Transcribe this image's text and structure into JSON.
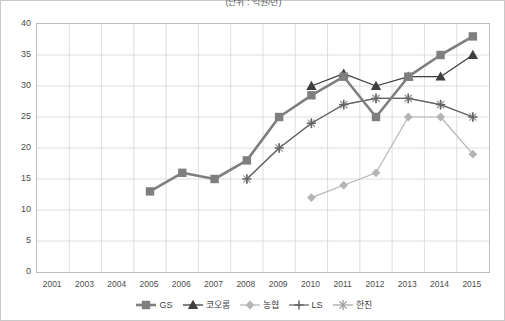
{
  "title": "(단위 : 억원/년)",
  "chart_data": {
    "type": "line",
    "title": "(단위 : 억원/년)",
    "xlabel": "",
    "ylabel": "",
    "ylim": [
      0,
      40
    ],
    "ytick_step": 5,
    "yticks": [
      0,
      5,
      10,
      15,
      20,
      25,
      30,
      35,
      40
    ],
    "grid": true,
    "legend_position": "bottom",
    "categories": [
      "2001",
      "2003",
      "2004",
      "2005",
      "2006",
      "2007",
      "2008",
      "2009",
      "2010",
      "2011",
      "2012",
      "2013",
      "2014",
      "2015"
    ],
    "series": [
      {
        "name": "GS",
        "marker": "square",
        "color": "#7f7f7f",
        "linewidth": 2.6,
        "values": [
          null,
          null,
          null,
          13,
          16,
          15,
          18,
          25,
          28.5,
          31.5,
          25,
          31.5,
          35,
          38
        ]
      },
      {
        "name": "코오롱",
        "marker": "triangle",
        "color": "#3f3f3f",
        "linewidth": 1.3,
        "values": [
          null,
          null,
          null,
          null,
          null,
          null,
          null,
          null,
          30,
          32,
          30,
          31.5,
          31.5,
          35
        ]
      },
      {
        "name": "농협",
        "marker": "diamond",
        "color": "#b5b5b5",
        "linewidth": 1.2,
        "values": [
          null,
          null,
          null,
          null,
          null,
          null,
          null,
          null,
          12,
          14,
          16,
          25,
          25,
          19
        ]
      },
      {
        "name": "LS",
        "marker": "plus",
        "color": "#636363",
        "linewidth": 1.2,
        "values": [
          null,
          null,
          null,
          null,
          null,
          null,
          15,
          20,
          24,
          27,
          28,
          28,
          27,
          25
        ]
      },
      {
        "name": "한진",
        "marker": "asterisk",
        "color": "#9a9a9a",
        "linewidth": 1.1,
        "values": [
          null,
          null,
          null,
          null,
          null,
          null,
          15,
          20,
          24,
          27,
          28,
          28,
          27,
          25
        ]
      }
    ]
  },
  "legend": [
    {
      "label": "GS"
    },
    {
      "label": "코오롱"
    },
    {
      "label": "농협"
    },
    {
      "label": "LS"
    },
    {
      "label": "한진"
    }
  ]
}
